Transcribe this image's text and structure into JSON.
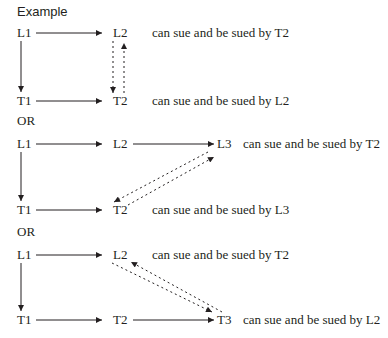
{
  "title": "Example",
  "separator_label": "OR",
  "scenarios": [
    {
      "nodes": {
        "top_left": "L1",
        "top_mid": "L2",
        "bottom_left": "T1",
        "bottom_mid": "T2"
      },
      "statements": [
        "can sue and be sued by T2",
        "can sue and be sued by L2"
      ]
    },
    {
      "nodes": {
        "top_left": "L1",
        "top_mid": "L2",
        "top_right": "L3",
        "bottom_left": "T1",
        "bottom_mid": "T2"
      },
      "statements": [
        "can sue and be sued by T2",
        "can sue and be sued by L3"
      ]
    },
    {
      "nodes": {
        "top_left": "L1",
        "top_mid": "L2",
        "bottom_left": "T1",
        "bottom_mid": "T2",
        "bottom_right": "T3"
      },
      "statements": [
        "can sue and be sued by T2",
        "can sue and be sued by L2"
      ]
    }
  ],
  "colors": {
    "ink": "#231f20",
    "background": "#ffffff"
  }
}
